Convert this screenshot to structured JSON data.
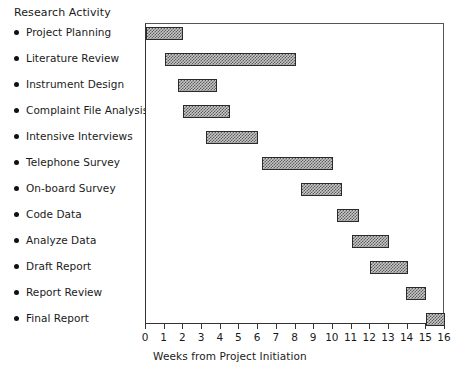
{
  "chart_data": {
    "type": "bar",
    "orientation": "horizontal",
    "subtype": "gantt",
    "title": "",
    "legend_title": "Research Activity",
    "xlabel": "Weeks from Project Initiation",
    "ylabel": "",
    "xlim": [
      0,
      16
    ],
    "xticks": [
      0,
      1,
      2,
      3,
      4,
      5,
      6,
      7,
      8,
      9,
      10,
      11,
      12,
      13,
      14,
      15,
      16
    ],
    "grid": false,
    "legend_position": "left-outside",
    "categories": [
      "Project Planning",
      "Literature Review",
      "Instrument Design",
      "Complaint File Analysis",
      "Intensive Interviews",
      "Telephone Survey",
      "On-board Survey",
      "Code Data",
      "Analyze Data",
      "Draft Report",
      "Report Review",
      "Final Report"
    ],
    "tasks": [
      {
        "activity": "Project Planning",
        "start": 0.0,
        "end": 2.0,
        "duration": 2.0
      },
      {
        "activity": "Literature Review",
        "start": 1.0,
        "end": 8.0,
        "duration": 7.0
      },
      {
        "activity": "Instrument Design",
        "start": 1.7,
        "end": 3.8,
        "duration": 2.1
      },
      {
        "activity": "Complaint File Analysis",
        "start": 2.0,
        "end": 4.5,
        "duration": 2.5
      },
      {
        "activity": "Intensive Interviews",
        "start": 3.2,
        "end": 6.0,
        "duration": 2.8
      },
      {
        "activity": "Telephone Survey",
        "start": 6.2,
        "end": 10.0,
        "duration": 3.8
      },
      {
        "activity": "On-board Survey",
        "start": 8.3,
        "end": 10.5,
        "duration": 2.2
      },
      {
        "activity": "Code Data",
        "start": 10.2,
        "end": 11.4,
        "duration": 1.2
      },
      {
        "activity": "Analyze Data",
        "start": 11.0,
        "end": 13.0,
        "duration": 2.0
      },
      {
        "activity": "Draft Report",
        "start": 12.0,
        "end": 14.0,
        "duration": 2.0
      },
      {
        "activity": "Report Review",
        "start": 13.9,
        "end": 15.0,
        "duration": 1.1
      },
      {
        "activity": "Final Report",
        "start": 15.0,
        "end": 16.0,
        "duration": 1.0
      }
    ],
    "bar_fill_color": "#c9c9c9",
    "bar_pattern": "checkerboard-hatch",
    "bar_edge_color": "#2a2a2a",
    "axis_color": "#333333",
    "background_color": "#ffffff"
  }
}
